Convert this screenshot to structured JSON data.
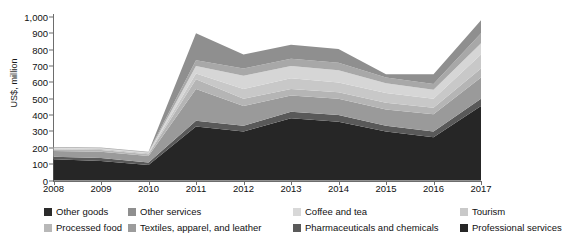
{
  "chart_data": {
    "type": "area",
    "stacked": true,
    "title": "",
    "xlabel": "",
    "ylabel": "US$, million",
    "x": [
      2008,
      2009,
      2010,
      2011,
      2012,
      2013,
      2014,
      2015,
      2016,
      2017
    ],
    "xtick_labels": [
      "2008",
      "2009",
      "2010",
      "2011",
      "2012",
      "2013",
      "2014",
      "2015",
      "2016",
      "2017"
    ],
    "ylim": [
      0,
      1000
    ],
    "ytick_values": [
      0,
      100,
      200,
      300,
      400,
      500,
      600,
      700,
      800,
      900,
      1000
    ],
    "ytick_labels": [
      "0",
      "100",
      "200",
      "300",
      "400",
      "500",
      "600",
      "700",
      "800",
      "900",
      "1,000"
    ],
    "grid": false,
    "legend_position": "bottom",
    "series": [
      {
        "name": "Professional services",
        "color": "#262626",
        "values": [
          130,
          120,
          95,
          330,
          300,
          380,
          360,
          300,
          265,
          455
        ]
      },
      {
        "name": "Pharmaceuticals and chemicals",
        "color": "#595959",
        "values": [
          15,
          18,
          15,
          35,
          35,
          40,
          40,
          35,
          35,
          45
        ]
      },
      {
        "name": "Textiles, apparel, and leather",
        "color": "#9a9a9a",
        "values": [
          35,
          38,
          40,
          195,
          120,
          100,
          100,
          100,
          105,
          130
        ]
      },
      {
        "name": "Processed food",
        "color": "#b5b5b5",
        "values": [
          10,
          10,
          10,
          60,
          45,
          40,
          40,
          40,
          40,
          55
        ]
      },
      {
        "name": "Tourism",
        "color": "#c8c8c8",
        "values": [
          5,
          6,
          6,
          35,
          60,
          65,
          60,
          60,
          55,
          85
        ]
      },
      {
        "name": "Coffee and tea",
        "color": "#d6d6d6",
        "values": [
          5,
          5,
          5,
          45,
          80,
          75,
          75,
          60,
          55,
          70
        ]
      },
      {
        "name": "Other services",
        "color": "#a8a8a8",
        "values": [
          5,
          5,
          5,
          35,
          45,
          45,
          45,
          35,
          35,
          60
        ]
      },
      {
        "name": "Other goods",
        "color": "#8f8f8f",
        "values": [
          0,
          0,
          0,
          165,
          85,
          85,
          85,
          20,
          60,
          80
        ]
      }
    ]
  },
  "legend": {
    "items": [
      {
        "label": "Other goods",
        "color": "#2b2b2b"
      },
      {
        "label": "Other services",
        "color": "#8f8f8f"
      },
      {
        "label": "Coffee and tea",
        "color": "#d8d8d8"
      },
      {
        "label": "Tourism",
        "color": "#c9c9c9"
      },
      {
        "label": "Processed food",
        "color": "#b8b8b8"
      },
      {
        "label": "Textiles, apparel, and leather",
        "color": "#9c9c9c"
      },
      {
        "label": "Pharmaceuticals and chemicals",
        "color": "#5a5a5a"
      },
      {
        "label": "Professional services",
        "color": "#262626"
      }
    ]
  }
}
